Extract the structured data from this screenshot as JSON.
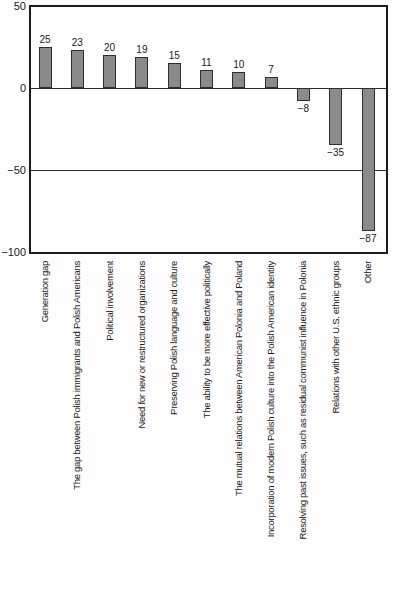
{
  "chart_data": {
    "type": "bar",
    "categories": [
      "Generation gap",
      "The gap between Polish immigrants and Polish Americans",
      "Political involvement",
      "Need for new or restructured organizations",
      "Preserving Polish language and culture",
      "The ability to be more effective politically",
      "The mutual relations between American Polonia and Poland",
      "Incorporation of modern Polish culture into the Polish American identity",
      "Resolving past issues, such as residual communist influence in Polonia",
      "Relations with other U.S. ethnic groups",
      "Other"
    ],
    "values": [
      25,
      23,
      20,
      19,
      15,
      11,
      10,
      7,
      -8,
      -35,
      -87
    ],
    "value_labels": [
      "25",
      "23",
      "20",
      "19",
      "15",
      "11",
      "10",
      "7",
      "−8",
      "−35",
      "−87"
    ],
    "title": "",
    "xlabel": "",
    "ylabel": "",
    "ylim": [
      -100,
      50
    ],
    "yticks": [
      50,
      0,
      -50,
      -100
    ],
    "ytick_labels": [
      "50",
      "0",
      "−50",
      "−100"
    ],
    "gridlines_at": [
      0,
      -50
    ],
    "grid": "horizontal lines at 0 and -50 only",
    "legend": "none",
    "orientation": "vertical bars, x labels rotated 90° reading bottom-to-top",
    "colors": {
      "bar_fill": "#8a8a8a",
      "bar_border": "#2e2e2e",
      "axis_border": "#1c1c1c",
      "background": "#fdfdfd",
      "text": "#1a1a1a"
    }
  }
}
